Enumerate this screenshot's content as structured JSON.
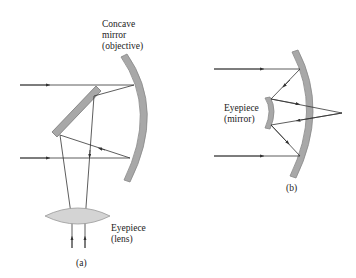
{
  "diagram_a": {
    "objective_label": [
      "Concave",
      "mirror",
      "(objective)"
    ],
    "eyepiece_label": [
      "Eyepiece",
      "(lens)"
    ],
    "caption": "(a)"
  },
  "diagram_b": {
    "eyepiece_label": [
      "Eyepiece",
      "(mirror)"
    ],
    "caption": "(b)"
  },
  "colors": {
    "mirror_fill": "#a8a8a8",
    "lens_fill": "#d4d4d4",
    "ray": "#333333"
  }
}
